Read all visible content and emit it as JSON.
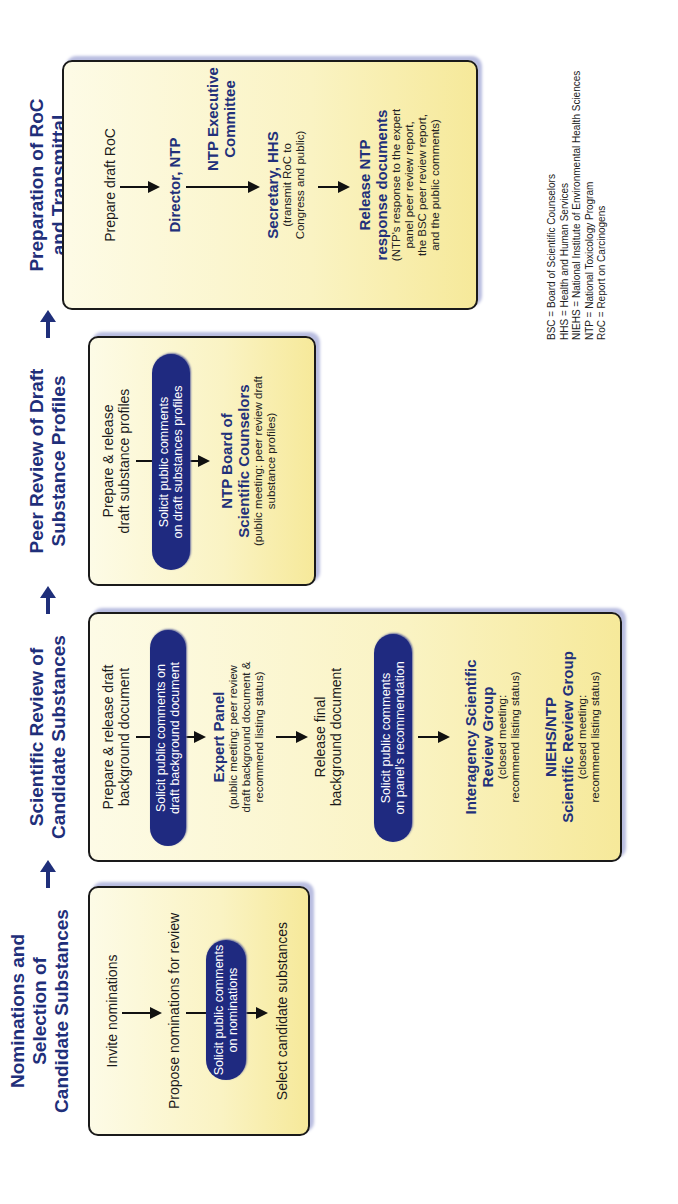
{
  "stages": [
    {
      "title": "Nominations and Selection of Candidate Substances",
      "title_lines": [
        "Nominations and",
        "Selection of",
        "Candidate Substances"
      ],
      "steps": [
        {
          "text": "Invite nominations"
        },
        {
          "text": "Propose nominations for review"
        },
        {
          "text": "Select candidate substances"
        }
      ],
      "pills": [
        {
          "line1": "Solicit public comments",
          "line2": "on nominations"
        }
      ]
    },
    {
      "title": "Scientific Review of Candidate Substances",
      "title_lines": [
        "Scientific Review of",
        "Candidate Substances"
      ],
      "steps": [
        {
          "line1": "Prepare & release draft",
          "line2": "background document"
        },
        {
          "main": "Expert Panel",
          "sub1": "(public meeting: peer review",
          "sub2": "draft background document &",
          "sub3": "recommend listing status)"
        },
        {
          "line1": "Release final",
          "line2": "background document"
        },
        {
          "main1": "Interagency Scientific",
          "main2": "Review Group",
          "sub1": "(closed meeting:",
          "sub2": "recommend listing status)"
        },
        {
          "main1": "NIEHS/NTP",
          "main2": "Scientific Review Group",
          "sub1": "(closed meeting:",
          "sub2": "recommend listing status)"
        }
      ],
      "pills": [
        {
          "line1": "Solicit public comments on",
          "line2": "draft background document"
        },
        {
          "line1": "Solicit public comments",
          "line2": "on panel's recommendation"
        }
      ]
    },
    {
      "title": "Peer Review of Draft Substance Profiles",
      "title_lines": [
        "Peer Review of Draft",
        "Substance Profiles"
      ],
      "steps": [
        {
          "line1": "Prepare & release",
          "line2": "draft substance profiles"
        },
        {
          "main1": "NTP Board of",
          "main2": "Scientific Counselors",
          "sub1": "(public meeting: peer review draft",
          "sub2": "substance profiles)"
        }
      ],
      "pills": [
        {
          "line1": "Solicit public comments",
          "line2": "on draft substances profiles"
        }
      ]
    },
    {
      "title": "Preparation of RoC and Transmittal",
      "title_lines": [
        "Preparation of RoC",
        "and Transmittal"
      ],
      "steps": [
        {
          "text": "Prepare draft RoC"
        },
        {
          "main": "Director, NTP"
        },
        {
          "main1": "NTP Executive",
          "main2": "Committee"
        },
        {
          "main": "Secretary, HHS",
          "sub1": "(transmit RoC to",
          "sub2": "Congress and public)"
        },
        {
          "main1": "Release NTP",
          "main2": "response documents",
          "sub1": "(NTP's response to the expert",
          "sub2": "panel peer review report,",
          "sub3": "the BSC peer review report,",
          "sub4": "and the public comments)"
        }
      ]
    }
  ],
  "legend": [
    "BSC = Board of Scientific Counselors",
    "HHS = Health and Human Services",
    "NIEHS = National Institute of Environmental Health Sciences",
    "NTP = National Toxicology Program",
    "RoC = Report on Carcinogens"
  ],
  "colors": {
    "title": "#1f2f7a",
    "pill": "#1f2a80",
    "box_fill": "#faf3c3",
    "box_border": "#1a1a1a",
    "arrow": "#111111",
    "stage_arrow": "#1f2f7a"
  }
}
